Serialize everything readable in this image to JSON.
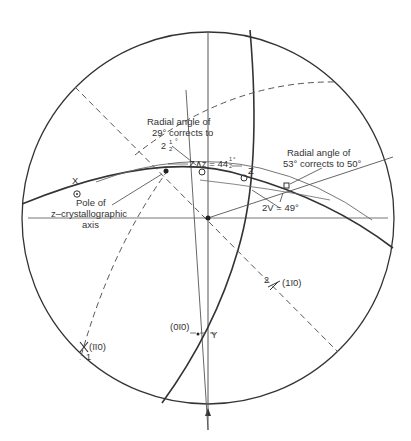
{
  "diagram": {
    "type": "stereographic projection (Wulff net) construction",
    "primitive_circle": {
      "cx": 208,
      "cy": 218,
      "r": 186
    },
    "labels": {
      "radial_29": [
        "Radial angle of",
        "29° corrects to",
        "2",
        "1",
        "2",
        "°"
      ],
      "radial_53": [
        "Radial angle of",
        "53° corrects to 50°"
      ],
      "pole": [
        "Pole of",
        "z–crystallographic",
        "axis"
      ],
      "z_angle": "Z∧z = 44",
      "z_angle_frac": [
        "1",
        "2"
      ],
      "z_angle_deg": "°",
      "Z": "Z",
      "X": "X",
      "Y": "Y",
      "two_v": "2V = 49°",
      "plane_110_bar": "(1ī0)",
      "plane_bar110": "(īī0)",
      "plane_0bar10": "(0ī0)",
      "num_1": "1",
      "num_2": "2"
    }
  }
}
